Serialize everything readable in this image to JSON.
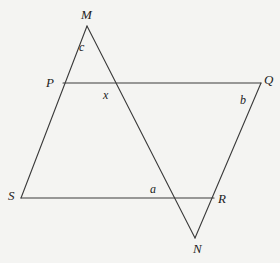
{
  "diagram": {
    "type": "geometry",
    "vertices": {
      "M": {
        "label": "M",
        "x": 87,
        "y": 26
      },
      "P": {
        "label": "P",
        "x": 63,
        "y": 83
      },
      "Q": {
        "label": "Q",
        "x": 261,
        "y": 83
      },
      "S": {
        "label": "S",
        "x": 21,
        "y": 198
      },
      "R": {
        "label": "R",
        "x": 214,
        "y": 198
      },
      "N": {
        "label": "N",
        "x": 195,
        "y": 238
      }
    },
    "angle_labels": {
      "c": {
        "label": "c",
        "x": 79,
        "y": 51
      },
      "x": {
        "label": "x",
        "x": 103,
        "y": 99
      },
      "b": {
        "label": "b",
        "x": 240,
        "y": 104
      },
      "a": {
        "label": "a",
        "x": 150,
        "y": 193
      }
    },
    "segments": [
      {
        "from": "M",
        "to": "S"
      },
      {
        "from": "P",
        "to": "Q"
      },
      {
        "from": "S",
        "to": "R"
      },
      {
        "from": "Q",
        "to": "N"
      },
      {
        "from": "M",
        "to": "N"
      }
    ],
    "colors": {
      "background": "#f4f4f2",
      "stroke": "#3a3a3a",
      "text": "#222222"
    }
  }
}
